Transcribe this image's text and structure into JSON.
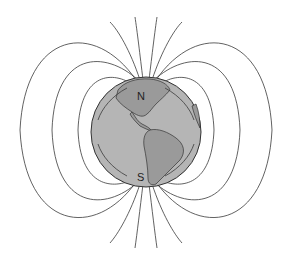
{
  "figure": {
    "labels": {
      "north": "N",
      "south": "S"
    },
    "colors": {
      "background": "#ffffff",
      "ocean": "#b5b5b5",
      "land": "#9a9a9a",
      "field_lines": "#3a3a3a",
      "outline": "#333333"
    }
  }
}
